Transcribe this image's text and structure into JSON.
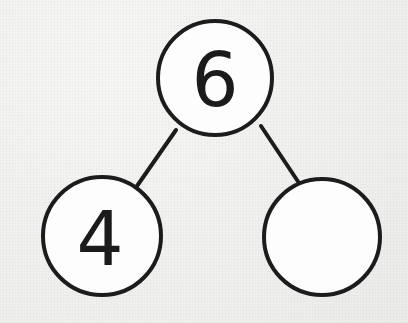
{
  "diagram": {
    "type": "number-bond",
    "background_color": "#f3f3f2",
    "stroke_color": "#1c1c1c",
    "fill_color": "#fdfdfd",
    "text_color": "#1b1b1b",
    "whole": {
      "label": "6",
      "role": "whole",
      "name": "whole-circle",
      "cx": 215,
      "cy": 78,
      "r": 57
    },
    "parts": [
      {
        "label": "4",
        "role": "part",
        "name": "part-circle-left",
        "cx": 102,
        "cy": 236,
        "r": 59
      },
      {
        "label": "",
        "role": "part",
        "name": "part-circle-right",
        "cx": 322,
        "cy": 237,
        "r": 58
      }
    ],
    "connectors": [
      {
        "name": "connector-left",
        "x1": 176,
        "y1": 130,
        "x2": 137,
        "y2": 186
      },
      {
        "name": "connector-right",
        "x1": 261,
        "y1": 126,
        "x2": 299,
        "y2": 183
      }
    ]
  }
}
